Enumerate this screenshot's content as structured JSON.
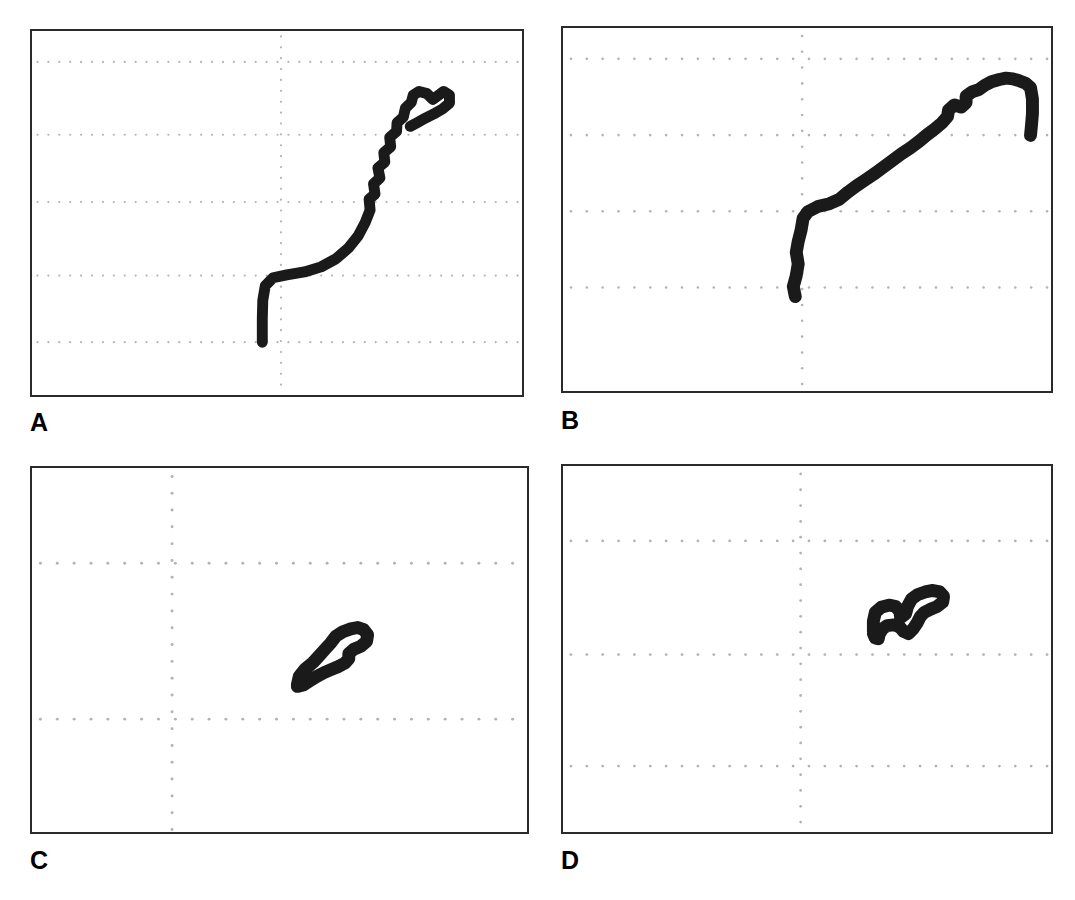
{
  "figure": {
    "type": "multi-panel-figure",
    "panel_count": 4,
    "background_color": "#ffffff",
    "border_color": "#2a2a2a",
    "grid_color": "#b3b3b3",
    "trace_color": "#1a1a1a"
  },
  "panels": [
    {
      "id": "A",
      "label": "A",
      "rect": {
        "x": 30,
        "y": 29,
        "w": 494,
        "h": 368
      },
      "label_pos": {
        "x": 30,
        "y": 410
      },
      "grid": {
        "h_lines_frac": [
          0.085,
          0.285,
          0.47,
          0.672,
          0.855
        ],
        "v_lines_frac": [
          0.508
        ],
        "dot_spacing_px": 11,
        "dot_radius_px": 1.1
      }
    },
    {
      "id": "B",
      "label": "B",
      "rect": {
        "x": 561,
        "y": 26,
        "w": 492,
        "h": 367
      },
      "label_pos": {
        "x": 561,
        "y": 408
      },
      "grid": {
        "h_lines_frac": [
          0.085,
          0.295,
          0.505,
          0.715
        ],
        "v_lines_frac": [
          0.49
        ],
        "dot_spacing_px": 16,
        "dot_radius_px": 1.3
      }
    },
    {
      "id": "C",
      "label": "C",
      "rect": {
        "x": 30,
        "y": 466,
        "w": 499,
        "h": 368
      },
      "label_pos": {
        "x": 30,
        "y": 848
      },
      "grid": {
        "h_lines_frac": [
          0.262,
          0.69
        ],
        "v_lines_frac": [
          0.283
        ],
        "dot_spacing_px": 17,
        "dot_radius_px": 1.5
      }
    },
    {
      "id": "D",
      "label": "D",
      "rect": {
        "x": 561,
        "y": 464,
        "w": 492,
        "h": 370
      },
      "label_pos": {
        "x": 561,
        "y": 848
      },
      "grid": {
        "h_lines_frac": [
          0.205,
          0.515,
          0.82
        ],
        "v_lines_frac": [
          0.487
        ],
        "dot_spacing_px": 16,
        "dot_radius_px": 1.4
      }
    }
  ],
  "chart_data": {
    "type": "line",
    "title": "",
    "xlabel": "",
    "ylabel": "",
    "panels": [
      {
        "id": "A",
        "title": "A",
        "xlim": [
          0,
          1
        ],
        "ylim": [
          0,
          1
        ],
        "grid": true,
        "series": [
          {
            "name": "trace-A",
            "stroke_width_px": 11,
            "points_frac": [
              [
                0.47,
                0.855
              ],
              [
                0.47,
                0.79
              ],
              [
                0.471,
                0.74
              ],
              [
                0.476,
                0.7
              ],
              [
                0.492,
                0.678
              ],
              [
                0.52,
                0.67
              ],
              [
                0.556,
                0.662
              ],
              [
                0.59,
                0.648
              ],
              [
                0.62,
                0.626
              ],
              [
                0.646,
                0.596
              ],
              [
                0.666,
                0.562
              ],
              [
                0.68,
                0.526
              ],
              [
                0.69,
                0.492
              ],
              [
                0.688,
                0.462
              ],
              [
                0.7,
                0.448
              ],
              [
                0.697,
                0.42
              ],
              [
                0.71,
                0.404
              ],
              [
                0.706,
                0.376
              ],
              [
                0.72,
                0.36
              ],
              [
                0.718,
                0.334
              ],
              [
                0.732,
                0.318
              ],
              [
                0.73,
                0.292
              ],
              [
                0.744,
                0.276
              ],
              [
                0.745,
                0.252
              ],
              [
                0.758,
                0.236
              ],
              [
                0.762,
                0.212
              ],
              [
                0.774,
                0.196
              ],
              [
                0.778,
                0.176
              ],
              [
                0.79,
                0.166
              ],
              [
                0.806,
                0.172
              ],
              [
                0.818,
                0.188
              ],
              [
                0.828,
                0.178
              ],
              [
                0.84,
                0.166
              ],
              [
                0.852,
                0.176
              ],
              [
                0.852,
                0.198
              ],
              [
                0.838,
                0.214
              ],
              [
                0.82,
                0.228
              ],
              [
                0.802,
                0.24
              ],
              [
                0.786,
                0.252
              ],
              [
                0.772,
                0.262
              ]
            ]
          }
        ]
      },
      {
        "id": "B",
        "title": "B",
        "xlim": [
          0,
          1
        ],
        "ylim": [
          0,
          1
        ],
        "grid": true,
        "series": [
          {
            "name": "trace-B",
            "stroke_width_px": 13,
            "points_frac": [
              [
                0.476,
                0.74
              ],
              [
                0.472,
                0.712
              ],
              [
                0.478,
                0.682
              ],
              [
                0.482,
                0.65
              ],
              [
                0.478,
                0.618
              ],
              [
                0.482,
                0.588
              ],
              [
                0.488,
                0.556
              ],
              [
                0.492,
                0.524
              ],
              [
                0.502,
                0.506
              ],
              [
                0.522,
                0.492
              ],
              [
                0.546,
                0.484
              ],
              [
                0.566,
                0.472
              ],
              [
                0.584,
                0.452
              ],
              [
                0.602,
                0.434
              ],
              [
                0.62,
                0.418
              ],
              [
                0.64,
                0.4
              ],
              [
                0.658,
                0.382
              ],
              [
                0.676,
                0.364
              ],
              [
                0.694,
                0.346
              ],
              [
                0.712,
                0.33
              ],
              [
                0.73,
                0.312
              ],
              [
                0.746,
                0.294
              ],
              [
                0.762,
                0.278
              ],
              [
                0.776,
                0.262
              ],
              [
                0.788,
                0.244
              ],
              [
                0.79,
                0.226
              ],
              [
                0.802,
                0.212
              ],
              [
                0.816,
                0.218
              ],
              [
                0.826,
                0.206
              ],
              [
                0.826,
                0.188
              ],
              [
                0.838,
                0.176
              ],
              [
                0.852,
                0.17
              ],
              [
                0.864,
                0.158
              ],
              [
                0.878,
                0.148
              ],
              [
                0.894,
                0.142
              ],
              [
                0.908,
                0.138
              ],
              [
                0.922,
                0.14
              ],
              [
                0.936,
                0.146
              ],
              [
                0.948,
                0.152
              ],
              [
                0.958,
                0.164
              ],
              [
                0.962,
                0.196
              ],
              [
                0.962,
                0.236
              ],
              [
                0.96,
                0.268
              ],
              [
                0.958,
                0.296
              ]
            ]
          }
        ]
      },
      {
        "id": "C",
        "title": "C",
        "xlim": [
          0,
          1
        ],
        "ylim": [
          0,
          1
        ],
        "grid": true,
        "series": [
          {
            "name": "trace-C",
            "stroke_width_px": 13,
            "points_frac": [
              [
                0.536,
                0.596
              ],
              [
                0.54,
                0.572
              ],
              [
                0.552,
                0.552
              ],
              [
                0.568,
                0.534
              ],
              [
                0.58,
                0.516
              ],
              [
                0.592,
                0.498
              ],
              [
                0.604,
                0.48
              ],
              [
                0.614,
                0.462
              ],
              [
                0.628,
                0.45
              ],
              [
                0.644,
                0.442
              ],
              [
                0.658,
                0.438
              ],
              [
                0.67,
                0.444
              ],
              [
                0.678,
                0.458
              ],
              [
                0.676,
                0.476
              ],
              [
                0.664,
                0.49
              ],
              [
                0.65,
                0.498
              ],
              [
                0.64,
                0.51
              ],
              [
                0.64,
                0.524
              ],
              [
                0.632,
                0.536
              ],
              [
                0.618,
                0.546
              ],
              [
                0.604,
                0.554
              ],
              [
                0.59,
                0.562
              ],
              [
                0.576,
                0.572
              ],
              [
                0.562,
                0.584
              ],
              [
                0.548,
                0.596
              ],
              [
                0.536,
                0.6
              ]
            ]
          }
        ]
      },
      {
        "id": "D",
        "title": "D",
        "xlim": [
          0,
          1
        ],
        "ylim": [
          0,
          1
        ],
        "grid": true,
        "series": [
          {
            "name": "trace-D",
            "stroke_width_px": 13,
            "points_frac": [
              [
                0.636,
                0.452
              ],
              [
                0.636,
                0.424
              ],
              [
                0.64,
                0.4
              ],
              [
                0.652,
                0.386
              ],
              [
                0.668,
                0.38
              ],
              [
                0.682,
                0.384
              ],
              [
                0.69,
                0.398
              ],
              [
                0.692,
                0.414
              ],
              [
                0.702,
                0.404
              ],
              [
                0.706,
                0.384
              ],
              [
                0.714,
                0.364
              ],
              [
                0.726,
                0.352
              ],
              [
                0.742,
                0.344
              ],
              [
                0.758,
                0.34
              ],
              [
                0.772,
                0.344
              ],
              [
                0.78,
                0.356
              ],
              [
                0.778,
                0.372
              ],
              [
                0.766,
                0.384
              ],
              [
                0.752,
                0.392
              ],
              [
                0.74,
                0.4
              ],
              [
                0.732,
                0.412
              ],
              [
                0.726,
                0.428
              ],
              [
                0.718,
                0.444
              ],
              [
                0.708,
                0.458
              ],
              [
                0.698,
                0.452
              ],
              [
                0.69,
                0.44
              ],
              [
                0.678,
                0.434
              ],
              [
                0.664,
                0.436
              ],
              [
                0.654,
                0.446
              ],
              [
                0.648,
                0.46
              ],
              [
                0.646,
                0.472
              ],
              [
                0.64,
                0.47
              ],
              [
                0.636,
                0.458
              ]
            ]
          }
        ]
      }
    ]
  }
}
